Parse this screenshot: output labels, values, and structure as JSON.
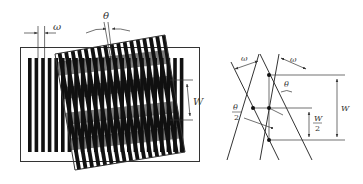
{
  "figure": {
    "left_panel": {
      "name": "moire-fringe-grating-overlay",
      "labels": {
        "pitch": "ω",
        "angle": "θ",
        "fringe_width": "W"
      },
      "grating": {
        "bar_count": 24,
        "bar_color": "#111111"
      }
    },
    "right_panel": {
      "name": "moire-geometry-construction",
      "labels": {
        "pitch_left": "ω",
        "pitch_right": "ω",
        "angle": "θ",
        "half_angle_num": "θ",
        "half_angle_den": "2",
        "half_width_num": "W",
        "half_width_den": "2",
        "fringe_width": "W"
      }
    },
    "colors": {
      "line": "#333333",
      "bar": "#111111",
      "background": "#ffffff"
    }
  }
}
